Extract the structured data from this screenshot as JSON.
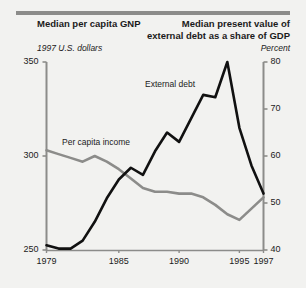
{
  "figure": {
    "background_color": "#f2f2f0",
    "rule_color": "#8c8c8a"
  },
  "titles": {
    "left": "Median per capita GNP",
    "left_subtitle": "1997 U.S. dollars",
    "right": "Median present value of external debt as a share of GDP",
    "right_subtitle": "Percent"
  },
  "chart_data": {
    "type": "line",
    "xlabel": "",
    "ylabel": "1997 U.S. dollars",
    "y2label": "Percent",
    "grid": false,
    "legend": "inline-annotations",
    "x": [
      1979,
      1980,
      1981,
      1982,
      1983,
      1984,
      1985,
      1986,
      1987,
      1988,
      1989,
      1990,
      1991,
      1992,
      1993,
      1994,
      1995,
      1996,
      1997
    ],
    "xlim": [
      1979,
      1997
    ],
    "xticks": [
      1979,
      1985,
      1990,
      1995,
      1997
    ],
    "xticklabels": [
      "1979",
      "1985",
      "1990",
      "1995",
      "1997"
    ],
    "ylim": [
      250,
      350
    ],
    "yticks": [
      250,
      300,
      350
    ],
    "yticklabels": [
      "250",
      "300",
      "350"
    ],
    "y2lim": [
      40,
      80
    ],
    "y2ticks": [
      40,
      50,
      60,
      70,
      80
    ],
    "y2ticklabels": [
      "40",
      "50",
      "60",
      "70",
      "80"
    ],
    "series": [
      {
        "name": "Per capita income",
        "label": "Per capita income",
        "axis": "left",
        "color": "#8c8c8a",
        "units": "1997 U.S. dollars",
        "values": [
          303,
          301,
          299,
          297,
          300,
          297,
          293,
          288,
          283,
          281,
          281,
          280,
          280,
          278,
          274,
          269,
          266,
          272,
          278
        ]
      },
      {
        "name": "External debt",
        "label": "External debt",
        "axis": "right",
        "color": "#111111",
        "units": "Percent of GDP",
        "values": [
          41,
          40.3,
          40.3,
          42,
          46,
          51,
          55,
          57.5,
          56,
          61,
          65,
          63,
          68,
          73,
          72.5,
          80,
          66,
          58,
          52
        ]
      }
    ]
  }
}
